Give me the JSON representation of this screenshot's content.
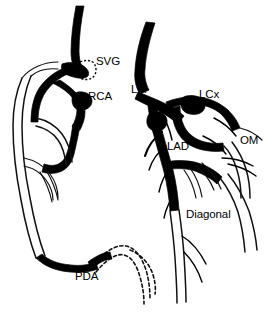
{
  "figure": {
    "kind": "coronary-artery-anatomy-diagram",
    "background_color": "#ffffff",
    "line_color": "#000000",
    "width": 268,
    "height": 319
  },
  "labels": {
    "svg": "SVG",
    "rca": "RCA",
    "lm": "LM",
    "lcx": "LCx",
    "om": "OM",
    "lad": "LAD",
    "diagonal": "Diagonal",
    "pda": "PDA"
  },
  "label_positions": {
    "svg": {
      "x": 96,
      "y": 62
    },
    "rca": {
      "x": 88,
      "y": 97
    },
    "lm": {
      "x": 131,
      "y": 90
    },
    "lcx": {
      "x": 199,
      "y": 95
    },
    "om": {
      "x": 240,
      "y": 141
    },
    "lad": {
      "x": 167,
      "y": 147
    },
    "diagonal": {
      "x": 186,
      "y": 215
    },
    "pda": {
      "x": 75,
      "y": 277
    }
  },
  "vessels": [
    {
      "name": "aorta-root",
      "style": "filled",
      "label": null
    },
    {
      "name": "svg-graft",
      "style": "filled",
      "label": "SVG"
    },
    {
      "name": "rca-main",
      "style": "filled",
      "label": "RCA"
    },
    {
      "name": "rca-distal",
      "style": "outline",
      "label": null
    },
    {
      "name": "pda-branch",
      "style": "dashed",
      "label": "PDA"
    },
    {
      "name": "left-main",
      "style": "filled",
      "label": "LM"
    },
    {
      "name": "lad-main",
      "style": "filled",
      "label": "LAD"
    },
    {
      "name": "lcx-main",
      "style": "filled",
      "label": "LCx"
    },
    {
      "name": "om-branch",
      "style": "outline",
      "label": "OM"
    },
    {
      "name": "diagonal-branch",
      "style": "outline",
      "label": "Diagonal"
    }
  ]
}
